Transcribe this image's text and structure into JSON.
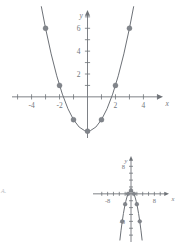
{
  "page": {
    "choice_label": "A."
  },
  "chart_data": [
    {
      "id": "main",
      "type": "line",
      "title": "",
      "xlabel": "x",
      "ylabel": "y",
      "equation": "y = x^2 - 3",
      "xlim": [
        -5.4,
        5.4
      ],
      "ylim": [
        -3.6,
        7.6
      ],
      "xticks": [
        -5,
        -4,
        -3,
        -2,
        -1,
        1,
        2,
        3,
        4,
        5
      ],
      "yticks": [
        1,
        2,
        3,
        4,
        5,
        6,
        7
      ],
      "xtick_labels": [
        {
          "value": -4,
          "label": "-4"
        },
        {
          "value": -2,
          "label": "-2"
        },
        {
          "value": 2,
          "label": "2"
        },
        {
          "value": 4,
          "label": "4"
        }
      ],
      "ytick_labels": [
        {
          "value": 2,
          "label": "2"
        },
        {
          "value": 4,
          "label": "4"
        },
        {
          "value": 6,
          "label": "6"
        }
      ],
      "grid": false,
      "legend": "none",
      "points": [
        {
          "x": -3,
          "y": 6
        },
        {
          "x": -2,
          "y": 1
        },
        {
          "x": -1,
          "y": -2
        },
        {
          "x": 0,
          "y": -3
        },
        {
          "x": 1,
          "y": -2
        },
        {
          "x": 2,
          "y": 1
        },
        {
          "x": 3,
          "y": 6
        }
      ],
      "curve": {
        "x": [
          -3.3,
          -3.0,
          -2.6,
          -2.2,
          -1.8,
          -1.4,
          -1.0,
          -0.6,
          -0.2,
          0,
          0.2,
          0.6,
          1.0,
          1.4,
          1.8,
          2.2,
          2.6,
          3.0,
          3.3
        ],
        "y": [
          7.89,
          6.0,
          3.76,
          1.84,
          0.24,
          -1.04,
          -2.0,
          -2.64,
          -2.96,
          -3.0,
          -2.96,
          -2.64,
          -2.0,
          -1.04,
          0.24,
          1.84,
          3.76,
          6.0,
          7.89
        ]
      }
    },
    {
      "id": "inset",
      "type": "line",
      "title": "",
      "xlabel": "x",
      "ylabel": "y",
      "equation": "y = -x^2 + 1",
      "xlim": [
        -13,
        13
      ],
      "ylim": [
        -14,
        11
      ],
      "xticks": [
        -10,
        -8,
        -6,
        -4,
        -2,
        2,
        4,
        6,
        8,
        10
      ],
      "yticks": [
        -12,
        -10,
        -8,
        -6,
        -4,
        -2,
        2,
        4,
        6,
        8,
        10
      ],
      "xtick_labels": [
        {
          "value": -8,
          "label": "-8"
        },
        {
          "value": 8,
          "label": "8"
        }
      ],
      "ytick_labels": [
        {
          "value": 8,
          "label": "8"
        },
        {
          "value": -8,
          "label": "-8"
        }
      ],
      "grid": false,
      "legend": "none",
      "points": [
        {
          "x": -3,
          "y": -8
        },
        {
          "x": -2,
          "y": -3
        },
        {
          "x": -1,
          "y": 0
        },
        {
          "x": 0,
          "y": 1
        },
        {
          "x": 1,
          "y": 0
        },
        {
          "x": 2,
          "y": -3
        },
        {
          "x": 3,
          "y": -8
        }
      ],
      "curve": {
        "x": [
          -3.8,
          -3.4,
          -3.0,
          -2.6,
          -2.2,
          -1.8,
          -1.4,
          -1.0,
          -0.6,
          -0.2,
          0,
          0.2,
          0.6,
          1.0,
          1.4,
          1.8,
          2.2,
          2.6,
          3.0,
          3.4,
          3.8
        ],
        "y": [
          -13.44,
          -10.56,
          -8.0,
          -5.76,
          -3.84,
          -2.24,
          -0.96,
          0.0,
          0.64,
          0.96,
          1.0,
          0.96,
          0.64,
          0.0,
          -0.96,
          -2.24,
          -3.84,
          -5.76,
          -8.0,
          -10.56,
          -13.44
        ]
      }
    }
  ]
}
